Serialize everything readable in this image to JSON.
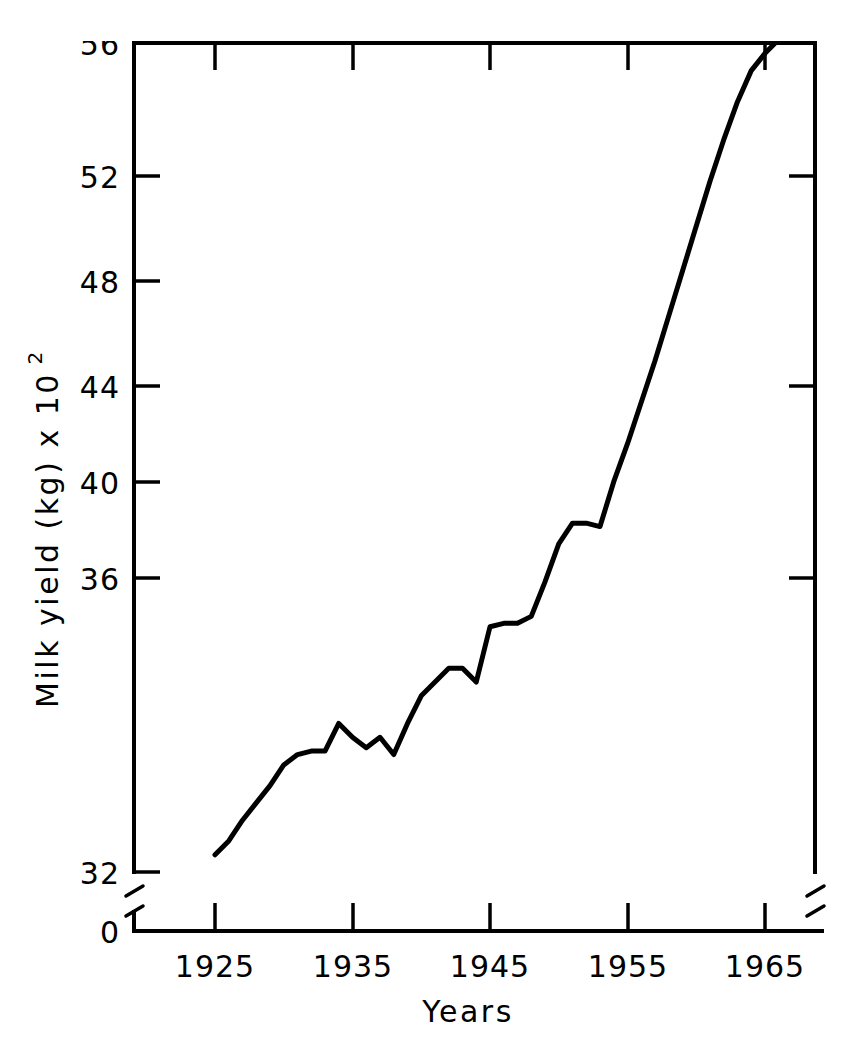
{
  "chart_data": {
    "type": "line",
    "title": "",
    "xlabel": "Years",
    "ylabel": "Milk yield  (kg) x 10",
    "ylabel_superscript": "2",
    "xlim": [
      1921.5,
      1967.5
    ],
    "ylim": [
      32,
      56
    ],
    "ylim_display_break_at": 0,
    "grid": false,
    "legend": null,
    "x_tick_labels": [
      "1925",
      "1935",
      "1945",
      "1955",
      "1965"
    ],
    "x_tick_values": [
      1925,
      1935,
      1945,
      1955,
      1965
    ],
    "y_tick_labels": [
      "32",
      "36",
      "40",
      "44",
      "48",
      "52",
      "56"
    ],
    "y_tick_values": [
      32,
      36,
      40,
      44,
      48,
      52,
      56
    ],
    "y_origin_label": "0",
    "axis_break": true,
    "series": [
      {
        "name": "Milk yield",
        "x": [
          1925,
          1926,
          1927,
          1928,
          1929,
          1930,
          1931,
          1932,
          1933,
          1934,
          1935,
          1936,
          1937,
          1938,
          1939,
          1940,
          1941,
          1942,
          1943,
          1944,
          1945,
          1946,
          1947,
          1948,
          1949,
          1950,
          1951,
          1952,
          1953,
          1954,
          1955,
          1956,
          1957,
          1958,
          1959,
          1960,
          1961,
          1962,
          1963,
          1964,
          1965,
          1966
        ],
        "values": [
          32.5,
          32.9,
          33.5,
          34.0,
          34.5,
          35.1,
          35.4,
          35.5,
          35.5,
          36.3,
          35.9,
          35.6,
          35.9,
          35.4,
          36.3,
          37.1,
          37.5,
          37.9,
          37.9,
          37.5,
          39.1,
          39.2,
          39.2,
          39.4,
          40.4,
          41.5,
          42.1,
          42.1,
          42.0,
          43.3,
          44.4,
          45.6,
          46.8,
          48.1,
          49.4,
          50.7,
          52.0,
          53.2,
          54.3,
          55.2,
          55.7,
          56.1
        ]
      }
    ]
  },
  "axis": {
    "y_title_main": "Milk yield  (kg) x 10",
    "y_title_sup": "2",
    "x_title": "Years",
    "origin_label": "0"
  },
  "y_ticks": [
    {
      "label": "56",
      "value": 56
    },
    {
      "label": "52",
      "value": 52
    },
    {
      "label": "48",
      "value": 48
    },
    {
      "label": "44",
      "value": 44
    },
    {
      "label": "40",
      "value": 40
    },
    {
      "label": "36",
      "value": 36
    },
    {
      "label": "32",
      "value": 32
    }
  ],
  "x_ticks": [
    {
      "label": "1925",
      "value": 1925
    },
    {
      "label": "1935",
      "value": 1935
    },
    {
      "label": "1945",
      "value": 1945
    },
    {
      "label": "1955",
      "value": 1955
    },
    {
      "label": "1965",
      "value": 1965
    }
  ],
  "colors": {
    "line": "#000000",
    "axis": "#000000",
    "background": "#ffffff"
  }
}
